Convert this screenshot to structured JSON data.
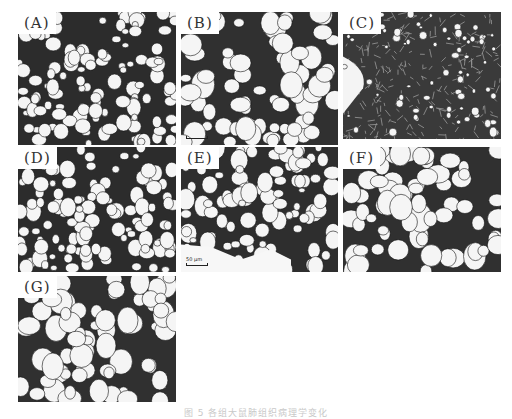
{
  "figure": {
    "panels": [
      {
        "id": "A",
        "label": "(A)",
        "tissue": "dense-alveolar",
        "x": 18,
        "y": 12,
        "w": 158,
        "h": 133
      },
      {
        "id": "B",
        "label": "(B)",
        "tissue": "open-alveolar",
        "x": 181,
        "y": 12,
        "w": 157,
        "h": 133,
        "scale_bar": true
      },
      {
        "id": "C",
        "label": "(C)",
        "tissue": "consolidated",
        "x": 343,
        "y": 12,
        "w": 158,
        "h": 127
      },
      {
        "id": "D",
        "label": "(D)",
        "tissue": "dense-alveolar",
        "x": 18,
        "y": 147,
        "w": 158,
        "h": 125
      },
      {
        "id": "E",
        "label": "(E)",
        "tissue": "mixed-alveolar",
        "x": 181,
        "y": 147,
        "w": 157,
        "h": 125,
        "scale_bar": true,
        "scale_label": "50 μm"
      },
      {
        "id": "F",
        "label": "(F)",
        "tissue": "open-alveolar",
        "x": 343,
        "y": 147,
        "w": 158,
        "h": 125
      },
      {
        "id": "G",
        "label": "(G)",
        "tissue": "open-alveolar",
        "x": 18,
        "y": 276,
        "w": 158,
        "h": 126
      }
    ],
    "caption": "图 5  各组大鼠肺组织病理学变化"
  }
}
